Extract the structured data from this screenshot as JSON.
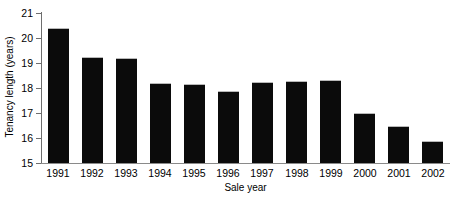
{
  "chart_data": {
    "type": "bar",
    "title": "",
    "subtitle": "",
    "xlabel": "Sale year",
    "ylabel": "Tenancy length (years)",
    "categories": [
      "1991",
      "1992",
      "1993",
      "1994",
      "1995",
      "1996",
      "1997",
      "1998",
      "1999",
      "2000",
      "2001",
      "2002"
    ],
    "values": [
      20.4,
      19.25,
      19.2,
      18.2,
      18.18,
      17.9,
      18.23,
      18.28,
      18.32,
      17.0,
      16.48,
      15.87
    ],
    "series": [
      {
        "name": "Tenancy length",
        "values": [
          20.4,
          19.25,
          19.2,
          18.2,
          18.18,
          17.9,
          18.23,
          18.28,
          18.32,
          17.0,
          16.48,
          15.87
        ]
      }
    ],
    "ylim": [
      15,
      21
    ],
    "xlim_categories": 12,
    "y_ticks": [
      15,
      16,
      17,
      18,
      19,
      20,
      21
    ],
    "y_tick_labels": [
      "15",
      "16",
      "17",
      "18",
      "19",
      "20",
      "21"
    ],
    "grid": false,
    "legend": false,
    "legend_position": "none",
    "bar_color": "#0b0b0b",
    "axis_color": "#6e6e6e",
    "background_color": "#ffffff"
  }
}
